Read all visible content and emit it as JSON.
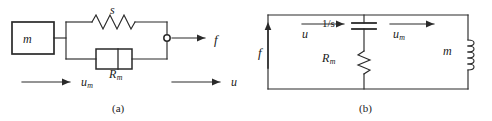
{
  "figure": {
    "panel_a": {
      "caption": "(a)",
      "labels": {
        "mass": "m",
        "spring": "s",
        "damper_base": "R",
        "damper_sub": "m",
        "force_out": "f",
        "velocity_mass_base": "u",
        "velocity_mass_sub": "m",
        "velocity_out": "u"
      },
      "elements": [
        "mass-block",
        "spring-element",
        "damper-element",
        "output-terminal-node",
        "force-arrow",
        "velocity-arrow-mass",
        "velocity-arrow-output"
      ]
    },
    "panel_b": {
      "caption": "(b)",
      "labels": {
        "source": "f",
        "current_in": "u",
        "capacitor": "1/s",
        "resistor_base": "R",
        "resistor_sub": "m",
        "current_mass_base": "u",
        "current_mass_sub": "m",
        "inductor": "m"
      },
      "elements": [
        "current-source-arrow",
        "capacitor-element",
        "resistor-element",
        "inductor-element",
        "current-arrow-input",
        "current-arrow-mass"
      ]
    }
  },
  "style": {
    "line_color": "#2a2a2a",
    "text_color": "#1a1a1a",
    "background": "#ffffff"
  }
}
